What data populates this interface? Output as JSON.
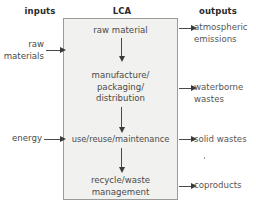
{
  "diagram": {
    "headers": {
      "inputs": "inputs",
      "center": "LCA",
      "outputs": "outputs"
    },
    "colors": {
      "box_fill": "#f1f1ef",
      "box_border": "#9a9a98",
      "header_text": "#2b2b2b",
      "body_text": "#4a4a4a",
      "output_text": "#555555",
      "arrow": "#3a3a3a",
      "background": "#ffffff"
    },
    "stages": [
      {
        "id": "raw-material",
        "label": "raw material"
      },
      {
        "id": "manufacture",
        "line1": "manufacture/",
        "line2": "packaging/",
        "line3": "distribution"
      },
      {
        "id": "use-reuse",
        "label": "use/reuse/maintenance"
      },
      {
        "id": "recycle-waste",
        "line1": "recycle/waste",
        "line2": "management"
      }
    ],
    "inputs": [
      {
        "id": "raw-materials",
        "line1": "raw",
        "line2": "materials"
      },
      {
        "id": "energy",
        "line1": "energy",
        "line2": ""
      }
    ],
    "outputs": [
      {
        "id": "atmospheric-emissions",
        "line1": "atmospheric",
        "line2": "emissions"
      },
      {
        "id": "waterborne-wastes",
        "line1": "waterborne",
        "line2": "wastes"
      },
      {
        "id": "solid-wastes",
        "line1": "solid wastes",
        "line2": ""
      },
      {
        "id": "coproducts",
        "line1": "coproducts",
        "line2": ""
      }
    ]
  }
}
